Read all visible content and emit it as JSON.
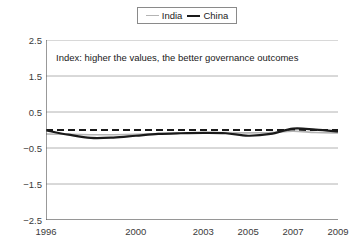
{
  "legend": {
    "position": "top-center",
    "entries": [
      {
        "name": "India",
        "color": "#b4b4b4",
        "style": "thin-line"
      },
      {
        "name": "China",
        "color": "#1a1a1a",
        "style": "thick-line"
      }
    ]
  },
  "annotation": {
    "text": "Index: higher the values, the better governance outcomes"
  },
  "chart_data": {
    "type": "line",
    "title": "",
    "subtitle": "",
    "xlabel": "",
    "ylabel": "",
    "annotations": [
      "Index: higher the values, the better governance outcomes"
    ],
    "grid": true,
    "legend_position": "top-center",
    "xlim": [
      1996,
      2009
    ],
    "ylim": [
      -2.5,
      2.5
    ],
    "ytick_labels": [
      "2.5",
      "1.5",
      "0.5",
      "-0.5",
      "-1.5",
      "-2.5"
    ],
    "yticks": [
      2.5,
      1.5,
      0.5,
      -0.5,
      -1.5,
      -2.5
    ],
    "xtick_labels": [
      "1996",
      "2000",
      "2003",
      "2005",
      "2007",
      "2009"
    ],
    "xticks": [
      1996,
      2000,
      2003,
      2005,
      2007,
      2009
    ],
    "xtick_minor": [
      1997,
      1998,
      1999,
      2001,
      2002,
      2004,
      2006,
      2008
    ],
    "reference_line": {
      "value": 0,
      "style": "dashed",
      "color": "#1a1a1a"
    },
    "x": [
      1996,
      1997,
      1998,
      1999,
      2000,
      2001,
      2002,
      2003,
      2004,
      2005,
      2006,
      2007,
      2008,
      2009
    ],
    "series": [
      {
        "name": "India",
        "color": "#b4b4b4",
        "width": 1.6,
        "values": [
          -0.11,
          -0.12,
          -0.13,
          -0.13,
          -0.12,
          -0.1,
          -0.09,
          -0.08,
          -0.07,
          -0.08,
          -0.07,
          -0.03,
          -0.07,
          -0.08
        ]
      },
      {
        "name": "China",
        "color": "#1a1a1a",
        "width": 2.2,
        "values": [
          -0.01,
          -0.13,
          -0.22,
          -0.21,
          -0.16,
          -0.11,
          -0.09,
          -0.08,
          -0.09,
          -0.16,
          -0.11,
          0.04,
          0.01,
          -0.04
        ]
      }
    ]
  }
}
